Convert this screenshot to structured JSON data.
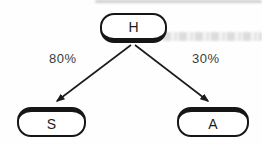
{
  "diagram": {
    "nodes": {
      "h": {
        "label": "H"
      },
      "s": {
        "label": "S"
      },
      "a": {
        "label": "A"
      }
    },
    "edges": {
      "h_to_s": {
        "from": "H",
        "to": "S",
        "label": "80%"
      },
      "h_to_a": {
        "from": "H",
        "to": "A",
        "label": "30%"
      }
    },
    "colors": {
      "node_border": "#161616",
      "node_fill": "#ffffff",
      "arrow": "#1b1b1b",
      "edge_label_text": "#3b3b3b"
    }
  }
}
